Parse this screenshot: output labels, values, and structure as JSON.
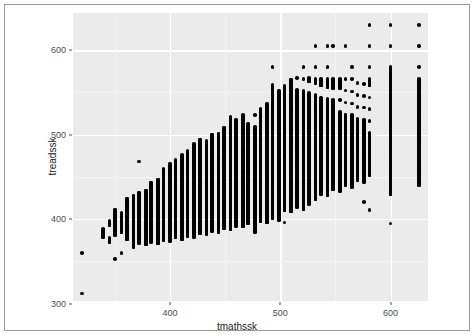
{
  "figure": {
    "background_color": "#ffffff",
    "border_color": "#9a9a9a",
    "panel_color": "#ebebeb",
    "gridline_color": "#ffffff",
    "point_color": "#000000"
  },
  "chart_data": {
    "type": "scatter",
    "title": "",
    "xlabel": "tmathssk",
    "ylabel": "treadssk",
    "xlim": [
      312,
      634
    ],
    "ylim": [
      303,
      644
    ],
    "xticks": [
      400,
      500,
      600
    ],
    "xtick_labels": [
      "400",
      "500",
      "600"
    ],
    "yticks": [
      300,
      400,
      500,
      600
    ],
    "ytick_labels": [
      "300",
      "400",
      "500",
      "600"
    ],
    "x_minor_ticks": [
      350,
      450,
      550
    ],
    "y_minor_ticks": [
      350,
      450,
      550
    ],
    "grid": true,
    "legend": null,
    "marker": "filled-circle",
    "marker_color": "#000000",
    "columns": [
      {
        "x": 320,
        "y": [
          312,
          360
        ]
      },
      {
        "x": 339,
        "y": [
          379,
          388
        ]
      },
      {
        "x": 345,
        "y": [
          373,
          378,
          393,
          398
        ]
      },
      {
        "x": 350,
        "y": [
          353,
          381,
          389,
          394,
          399,
          404,
          411
        ]
      },
      {
        "x": 356,
        "y": [
          360,
          385,
          390,
          396,
          401,
          407
        ]
      },
      {
        "x": 361,
        "y": [
          376,
          382,
          388,
          393,
          399,
          404,
          410,
          417,
          424
        ]
      },
      {
        "x": 367,
        "y": [
          367,
          379,
          385,
          391,
          397,
          403,
          409,
          415,
          421,
          428
        ]
      },
      {
        "x": 372,
        "y": [
          468,
          372,
          381,
          387,
          393,
          399,
          405,
          411,
          417,
          424,
          431
        ]
      },
      {
        "x": 378,
        "y": [
          370,
          378,
          384,
          390,
          396,
          402,
          408,
          414,
          420,
          427,
          434
        ]
      },
      {
        "x": 383,
        "y": [
          373,
          380,
          386,
          392,
          398,
          404,
          410,
          416,
          422,
          429,
          436,
          443
        ]
      },
      {
        "x": 389,
        "y": [
          371,
          377,
          383,
          389,
          395,
          401,
          407,
          413,
          419,
          426,
          433,
          440,
          447
        ]
      },
      {
        "x": 394,
        "y": [
          375,
          381,
          387,
          393,
          399,
          405,
          411,
          417,
          423,
          430,
          437,
          444,
          451,
          459
        ]
      },
      {
        "x": 400,
        "y": [
          374,
          380,
          386,
          392,
          398,
          404,
          410,
          416,
          423,
          430,
          437,
          444,
          451,
          458,
          466
        ]
      },
      {
        "x": 405,
        "y": [
          378,
          384,
          390,
          396,
          402,
          408,
          414,
          420,
          427,
          434,
          441,
          448,
          455,
          462,
          470
        ]
      },
      {
        "x": 411,
        "y": [
          376,
          382,
          388,
          394,
          400,
          406,
          412,
          419,
          426,
          433,
          440,
          447,
          454,
          461,
          468,
          476
        ]
      },
      {
        "x": 416,
        "y": [
          380,
          386,
          392,
          398,
          404,
          410,
          416,
          423,
          430,
          437,
          444,
          451,
          458,
          465,
          473,
          481
        ]
      },
      {
        "x": 422,
        "y": [
          379,
          385,
          391,
          397,
          403,
          409,
          415,
          422,
          429,
          436,
          443,
          450,
          457,
          464,
          472,
          480,
          489
        ]
      },
      {
        "x": 427,
        "y": [
          383,
          389,
          395,
          401,
          407,
          413,
          419,
          426,
          433,
          440,
          447,
          454,
          461,
          469,
          477,
          485,
          494
        ]
      },
      {
        "x": 433,
        "y": [
          382,
          388,
          394,
          400,
          406,
          412,
          418,
          425,
          432,
          439,
          446,
          453,
          461,
          469,
          477,
          485,
          493
        ]
      },
      {
        "x": 438,
        "y": [
          386,
          392,
          398,
          404,
          410,
          416,
          423,
          430,
          437,
          444,
          451,
          459,
          467,
          475,
          483,
          491,
          500
        ]
      },
      {
        "x": 444,
        "y": [
          385,
          391,
          397,
          403,
          409,
          415,
          422,
          429,
          436,
          443,
          451,
          459,
          467,
          475,
          483,
          492,
          501
        ]
      },
      {
        "x": 449,
        "y": [
          389,
          395,
          401,
          407,
          413,
          420,
          427,
          434,
          441,
          449,
          457,
          465,
          473,
          481,
          490,
          499,
          508
        ]
      },
      {
        "x": 455,
        "y": [
          388,
          394,
          400,
          406,
          412,
          419,
          426,
          433,
          441,
          449,
          457,
          465,
          473,
          482,
          491,
          500,
          510,
          521
        ]
      },
      {
        "x": 460,
        "y": [
          392,
          398,
          404,
          410,
          417,
          424,
          431,
          439,
          447,
          455,
          463,
          471,
          480,
          489,
          498,
          508,
          518
        ]
      },
      {
        "x": 466,
        "y": [
          391,
          397,
          403,
          410,
          417,
          424,
          432,
          440,
          448,
          456,
          465,
          474,
          483,
          492,
          502,
          512,
          523
        ]
      },
      {
        "x": 471,
        "y": [
          395,
          401,
          408,
          415,
          422,
          430,
          438,
          446,
          455,
          464,
          473,
          482,
          492,
          502,
          505,
          513
        ]
      },
      {
        "x": 477,
        "y": [
          385,
          394,
          400,
          407,
          414,
          422,
          430,
          438,
          447,
          456,
          465,
          474,
          484,
          494,
          500,
          509,
          523
        ]
      },
      {
        "x": 482,
        "y": [
          398,
          405,
          412,
          420,
          428,
          436,
          445,
          454,
          463,
          472,
          482,
          492,
          500,
          510,
          519,
          530
        ]
      },
      {
        "x": 488,
        "y": [
          396,
          403,
          410,
          418,
          426,
          434,
          443,
          452,
          461,
          471,
          481,
          491,
          501,
          512,
          524,
          537
        ]
      },
      {
        "x": 493,
        "y": [
          401,
          408,
          416,
          424,
          432,
          441,
          450,
          459,
          469,
          479,
          489,
          499,
          510,
          521,
          533,
          546,
          559,
          580
        ]
      },
      {
        "x": 499,
        "y": [
          399,
          406,
          414,
          422,
          430,
          439,
          448,
          458,
          468,
          478,
          488,
          499,
          510,
          522,
          534,
          547,
          552
        ]
      },
      {
        "x": 504,
        "y": [
          396,
          411,
          419,
          427,
          436,
          445,
          455,
          465,
          475,
          486,
          497,
          508,
          520,
          532,
          545,
          558
        ]
      },
      {
        "x": 510,
        "y": [
          409,
          417,
          425,
          434,
          443,
          453,
          463,
          473,
          484,
          495,
          506,
          518,
          530,
          543,
          556,
          565
        ]
      },
      {
        "x": 515,
        "y": [
          414,
          422,
          431,
          440,
          450,
          460,
          470,
          481,
          492,
          503,
          515,
          527,
          540,
          553,
          567
        ]
      },
      {
        "x": 521,
        "y": [
          412,
          421,
          430,
          439,
          449,
          459,
          469,
          480,
          491,
          502,
          514,
          526,
          539,
          552,
          566,
          580
        ]
      },
      {
        "x": 526,
        "y": [
          418,
          427,
          436,
          446,
          456,
          466,
          477,
          488,
          499,
          511,
          523,
          536,
          549,
          563,
          567
        ]
      },
      {
        "x": 532,
        "y": [
          424,
          433,
          443,
          453,
          463,
          474,
          485,
          497,
          509,
          521,
          534,
          547,
          561,
          566,
          580,
          605
        ]
      },
      {
        "x": 537,
        "y": [
          430,
          440,
          450,
          460,
          471,
          482,
          494,
          506,
          518,
          531,
          544,
          558,
          566
        ]
      },
      {
        "x": 543,
        "y": [
          428,
          438,
          448,
          458,
          469,
          480,
          492,
          504,
          516,
          529,
          542,
          556,
          566,
          580,
          605
        ]
      },
      {
        "x": 548,
        "y": [
          435,
          445,
          456,
          467,
          478,
          490,
          502,
          515,
          528,
          541,
          555,
          566,
          605
        ]
      },
      {
        "x": 554,
        "y": [
          433,
          443,
          454,
          465,
          477,
          489,
          501,
          514,
          527,
          541,
          555,
          566
        ]
      },
      {
        "x": 559,
        "y": [
          440,
          451,
          462,
          474,
          486,
          498,
          511,
          524,
          538,
          552,
          566,
          605
        ]
      },
      {
        "x": 565,
        "y": [
          438,
          449,
          460,
          472,
          484,
          497,
          510,
          523,
          537,
          551,
          566,
          580
        ]
      },
      {
        "x": 570,
        "y": [
          446,
          457,
          469,
          481,
          493,
          506,
          519,
          533,
          547,
          561
        ]
      },
      {
        "x": 576,
        "y": [
          420,
          444,
          455,
          467,
          479,
          492,
          505,
          518,
          532,
          546,
          560
        ]
      },
      {
        "x": 581,
        "y": [
          411,
          452,
          464,
          476,
          489,
          502,
          516,
          530,
          544,
          558,
          566,
          580,
          605,
          630
        ]
      },
      {
        "x": 600,
        "y": [
          395,
          429,
          434,
          443,
          452,
          462,
          472,
          483,
          494,
          505,
          517,
          529,
          541,
          554,
          567,
          580,
          605,
          630
        ]
      },
      {
        "x": 626,
        "y": [
          440,
          445,
          455,
          465,
          475,
          485,
          495,
          500,
          505,
          510,
          515,
          520,
          525,
          530,
          535,
          540,
          546,
          552,
          558,
          566,
          580,
          605,
          630
        ]
      }
    ]
  }
}
